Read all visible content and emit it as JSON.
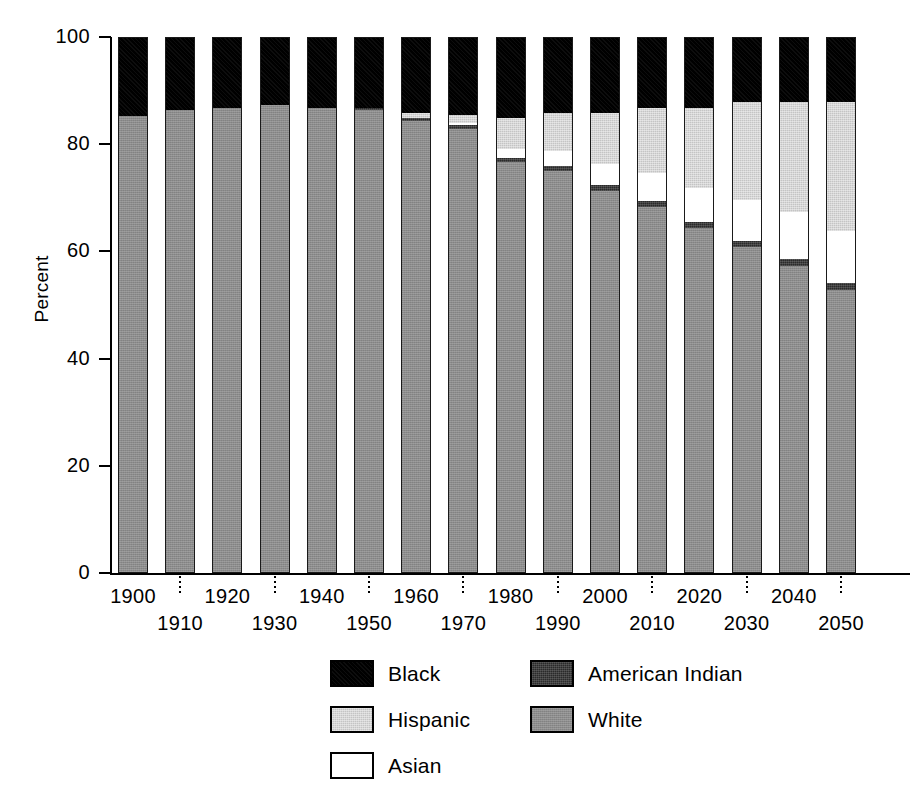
{
  "chart_data": {
    "type": "bar",
    "subtype": "stacked-bar-100-percent",
    "title": "",
    "xlabel": "",
    "ylabel": "Percent",
    "ylim": [
      0,
      100
    ],
    "yticks": [
      0,
      20,
      40,
      60,
      80,
      100
    ],
    "ytick_labels": [
      "0",
      "20",
      "40",
      "60",
      "80",
      "100"
    ],
    "grid": false,
    "legend_position": "bottom-center",
    "categories": [
      "1900",
      "1910",
      "1920",
      "1930",
      "1940",
      "1950",
      "1960",
      "1970",
      "1980",
      "1990",
      "2000",
      "2010",
      "2020",
      "2030",
      "2040",
      "2050"
    ],
    "series": [
      {
        "name": "White",
        "color": "#8c8c8c",
        "values": [
          85.5,
          86.5,
          87.0,
          87.5,
          87.0,
          86.5,
          84.5,
          83.0,
          76.8,
          75.2,
          71.5,
          68.5,
          64.5,
          61.0,
          57.5,
          53.0
        ]
      },
      {
        "name": "American Indian",
        "color": "#2a2a2a",
        "values": [
          0.0,
          0.0,
          0.0,
          0.0,
          0.0,
          0.5,
          0.6,
          0.7,
          0.8,
          0.9,
          1.0,
          1.1,
          1.1,
          1.2,
          1.2,
          1.3
        ]
      },
      {
        "name": "Asian",
        "color": "#ffffff",
        "values": [
          0.0,
          0.0,
          0.0,
          0.0,
          0.0,
          0.0,
          0.0,
          0.5,
          1.6,
          2.8,
          4.0,
          5.2,
          6.4,
          7.6,
          8.8,
          9.7
        ]
      },
      {
        "name": "Hispanic",
        "color": "#c4c4c4",
        "values": [
          0.0,
          0.0,
          0.0,
          0.0,
          0.0,
          0.0,
          1.0,
          1.5,
          5.8,
          7.1,
          9.5,
          12.2,
          15.0,
          18.2,
          20.5,
          24.0
        ]
      },
      {
        "name": "Black",
        "color": "#000000",
        "values": [
          14.5,
          13.5,
          13.0,
          12.5,
          13.0,
          13.0,
          13.9,
          14.3,
          15.0,
          14.0,
          14.0,
          13.0,
          13.0,
          12.0,
          12.0,
          12.0
        ]
      }
    ]
  },
  "axes": {
    "y_title": "Percent",
    "y_ticks": [
      {
        "value": 100,
        "label": "100"
      },
      {
        "value": 80,
        "label": "80"
      },
      {
        "value": 60,
        "label": "60"
      },
      {
        "value": 40,
        "label": "40"
      },
      {
        "value": 20,
        "label": "20"
      },
      {
        "value": 0,
        "label": "0"
      }
    ],
    "x_labels": [
      {
        "label": "1900",
        "row": "top"
      },
      {
        "label": "1910",
        "row": "bottom"
      },
      {
        "label": "1920",
        "row": "top"
      },
      {
        "label": "1930",
        "row": "bottom"
      },
      {
        "label": "1940",
        "row": "top"
      },
      {
        "label": "1950",
        "row": "bottom"
      },
      {
        "label": "1960",
        "row": "top"
      },
      {
        "label": "1970",
        "row": "bottom"
      },
      {
        "label": "1980",
        "row": "top"
      },
      {
        "label": "1990",
        "row": "bottom"
      },
      {
        "label": "2000",
        "row": "top"
      },
      {
        "label": "2010",
        "row": "bottom"
      },
      {
        "label": "2020",
        "row": "top"
      },
      {
        "label": "2030",
        "row": "bottom"
      },
      {
        "label": "2040",
        "row": "top"
      },
      {
        "label": "2050",
        "row": "bottom"
      }
    ]
  },
  "legend": {
    "rows": [
      [
        {
          "label": "Black",
          "swatch": "black",
          "color": "#000000"
        },
        {
          "label": "American Indian",
          "swatch": "amerindian",
          "color": "#2a2a2a"
        }
      ],
      [
        {
          "label": "Hispanic",
          "swatch": "hispanic",
          "color": "#c4c4c4"
        },
        {
          "label": "White",
          "swatch": "white",
          "color": "#8c8c8c"
        }
      ],
      [
        {
          "label": "Asian",
          "swatch": "asian",
          "color": "#ffffff"
        }
      ]
    ]
  }
}
